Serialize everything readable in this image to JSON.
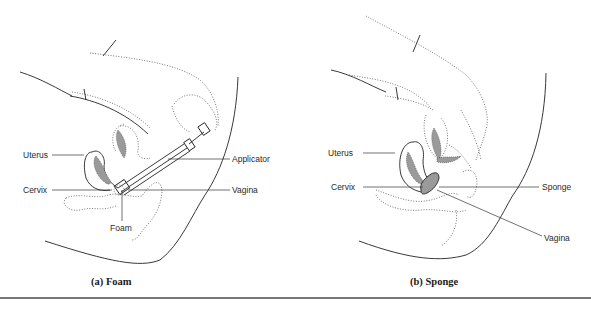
{
  "figure": {
    "panels": [
      {
        "id": "a",
        "caption_letter": "(a)",
        "caption_title": "Foam",
        "labels": {
          "uterus": "Uterus",
          "cervix": "Cervix",
          "foam": "Foam",
          "applicator": "Applicator",
          "vagina": "Vagina"
        }
      },
      {
        "id": "b",
        "caption_letter": "(b)",
        "caption_title": "Sponge",
        "labels": {
          "uterus": "Uterus",
          "cervix": "Cervix",
          "sponge": "Sponge",
          "vagina": "Vagina"
        }
      }
    ],
    "colors": {
      "line": "#222222",
      "dotted": "#555555",
      "fill_gray": "#9a9a9a",
      "rule": "#777777"
    }
  }
}
